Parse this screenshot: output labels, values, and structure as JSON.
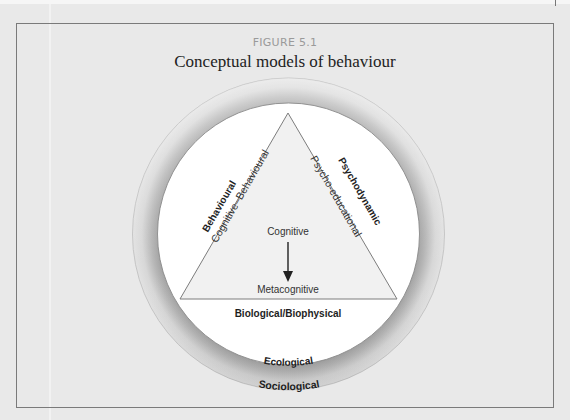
{
  "figure": {
    "label": "FIGURE 5.1",
    "title": "Conceptual models of behaviour"
  },
  "diagram": {
    "triangle": {
      "left_outer_label": "Behavioural",
      "left_inner_label": "Cognitive–Behavioural",
      "right_outer_label": "Psychodynamic",
      "right_inner_label": "Psycho-educational",
      "center_top_label": "Cognitive",
      "center_bottom_label": "Metacognitive",
      "arrow_direction": "down"
    },
    "inner_circle_label": "Biological/Biophysical",
    "inner_circle_bottom_label": "Ecological",
    "outer_ring_label": "Sociological"
  },
  "colors": {
    "page_background": "#e9e9e9",
    "frame_border": "#7a7a7a",
    "ring_dark": "#a9a9a9",
    "ring_light": "#e4e4e4",
    "inner_circle": "#ffffff",
    "triangle_fill": "#f1f1f1",
    "triangle_stroke": "#7c7c7c"
  }
}
